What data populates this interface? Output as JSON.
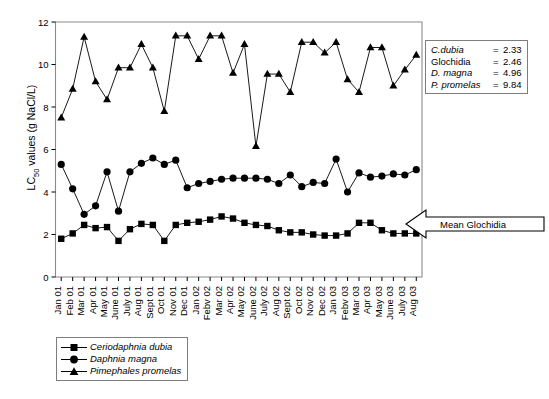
{
  "chart_data": {
    "type": "line",
    "title": "",
    "xlabel": "",
    "ylabel_parts": {
      "pre": "LC",
      "sub": "50",
      "post": " values (g NaCl/L)"
    },
    "ylabel": "LC50 values (g NaCl/L)",
    "ylim": [
      0,
      12
    ],
    "yticks": [
      0,
      2,
      4,
      6,
      8,
      10,
      12
    ],
    "grid": false,
    "legend_position": "below-plot-left",
    "categories": [
      "Jan 01",
      "Feb 01",
      "Mar 01",
      "Apr 01",
      "May 01",
      "June 01",
      "July 01",
      "Aug 01",
      "Sept 01",
      "Oct 01",
      "Nov 01",
      "Dec 01",
      "Jan 02",
      "Febv 02",
      "Mar 02",
      "Apr 02",
      "May 02",
      "June 02",
      "July 02",
      "Aug 02",
      "Sept 02",
      "Oct 02",
      "Nov 02",
      "Dec 02",
      "Jan 03",
      "Febv 03",
      "Mar 03",
      "Apr 03",
      "May 03",
      "June 03",
      "July 03",
      "Aug 03"
    ],
    "series": [
      {
        "name": "Ceriodaphnia dubia",
        "marker": "square",
        "values": [
          1.8,
          2.05,
          2.45,
          2.3,
          2.35,
          1.7,
          2.25,
          2.5,
          2.45,
          1.7,
          2.45,
          2.55,
          2.6,
          2.7,
          2.85,
          2.75,
          2.55,
          2.45,
          2.4,
          2.2,
          2.1,
          2.1,
          2.0,
          1.95,
          1.95,
          2.05,
          2.55,
          2.55,
          2.2,
          2.05,
          2.05,
          2.05
        ]
      },
      {
        "name": "Daphnia magna",
        "marker": "circle",
        "values": [
          5.3,
          4.15,
          2.95,
          3.35,
          4.95,
          3.1,
          4.95,
          5.35,
          5.6,
          5.3,
          5.5,
          4.2,
          4.4,
          4.5,
          4.6,
          4.65,
          4.65,
          4.65,
          4.6,
          4.4,
          4.8,
          4.25,
          4.45,
          4.4,
          5.55,
          4.0,
          4.9,
          4.7,
          4.75,
          4.85,
          4.8,
          5.05
        ]
      },
      {
        "name": "Pimephales promelas",
        "marker": "triangle",
        "values": [
          7.5,
          8.85,
          11.3,
          9.2,
          8.35,
          9.85,
          9.85,
          10.95,
          9.85,
          7.8,
          11.35,
          11.35,
          10.25,
          11.35,
          11.35,
          9.6,
          10.95,
          6.15,
          9.55,
          9.55,
          8.7,
          11.05,
          11.05,
          10.55,
          11.05,
          9.3,
          8.7,
          10.8,
          10.8,
          9.0,
          9.75,
          10.45
        ]
      }
    ],
    "annotations": [
      {
        "name": "mean-glochidia-callout",
        "text": "Mean Glochidia",
        "value": 2.46
      }
    ],
    "stats_box": {
      "rows": [
        {
          "label": "C.dubia",
          "eq": "=",
          "value": "2.33",
          "italic": true
        },
        {
          "label": "Glochidia",
          "eq": "=",
          "value": "2.46",
          "italic": false
        },
        {
          "label": "D. magna",
          "eq": "=",
          "value": "4.96",
          "italic": true
        },
        {
          "label": "P. promelas",
          "eq": "=",
          "value": "9.84",
          "italic": true
        }
      ]
    },
    "legend_entries": [
      {
        "label": "Ceriodaphnia dubia",
        "marker": "square"
      },
      {
        "label": "Daphnia magna",
        "marker": "circle"
      },
      {
        "label": "Pimephales promelas",
        "marker": "triangle"
      }
    ],
    "colors": {
      "line": "#000000",
      "marker": "#000000",
      "frame": "#8a8a8a",
      "text": "#000000"
    }
  }
}
